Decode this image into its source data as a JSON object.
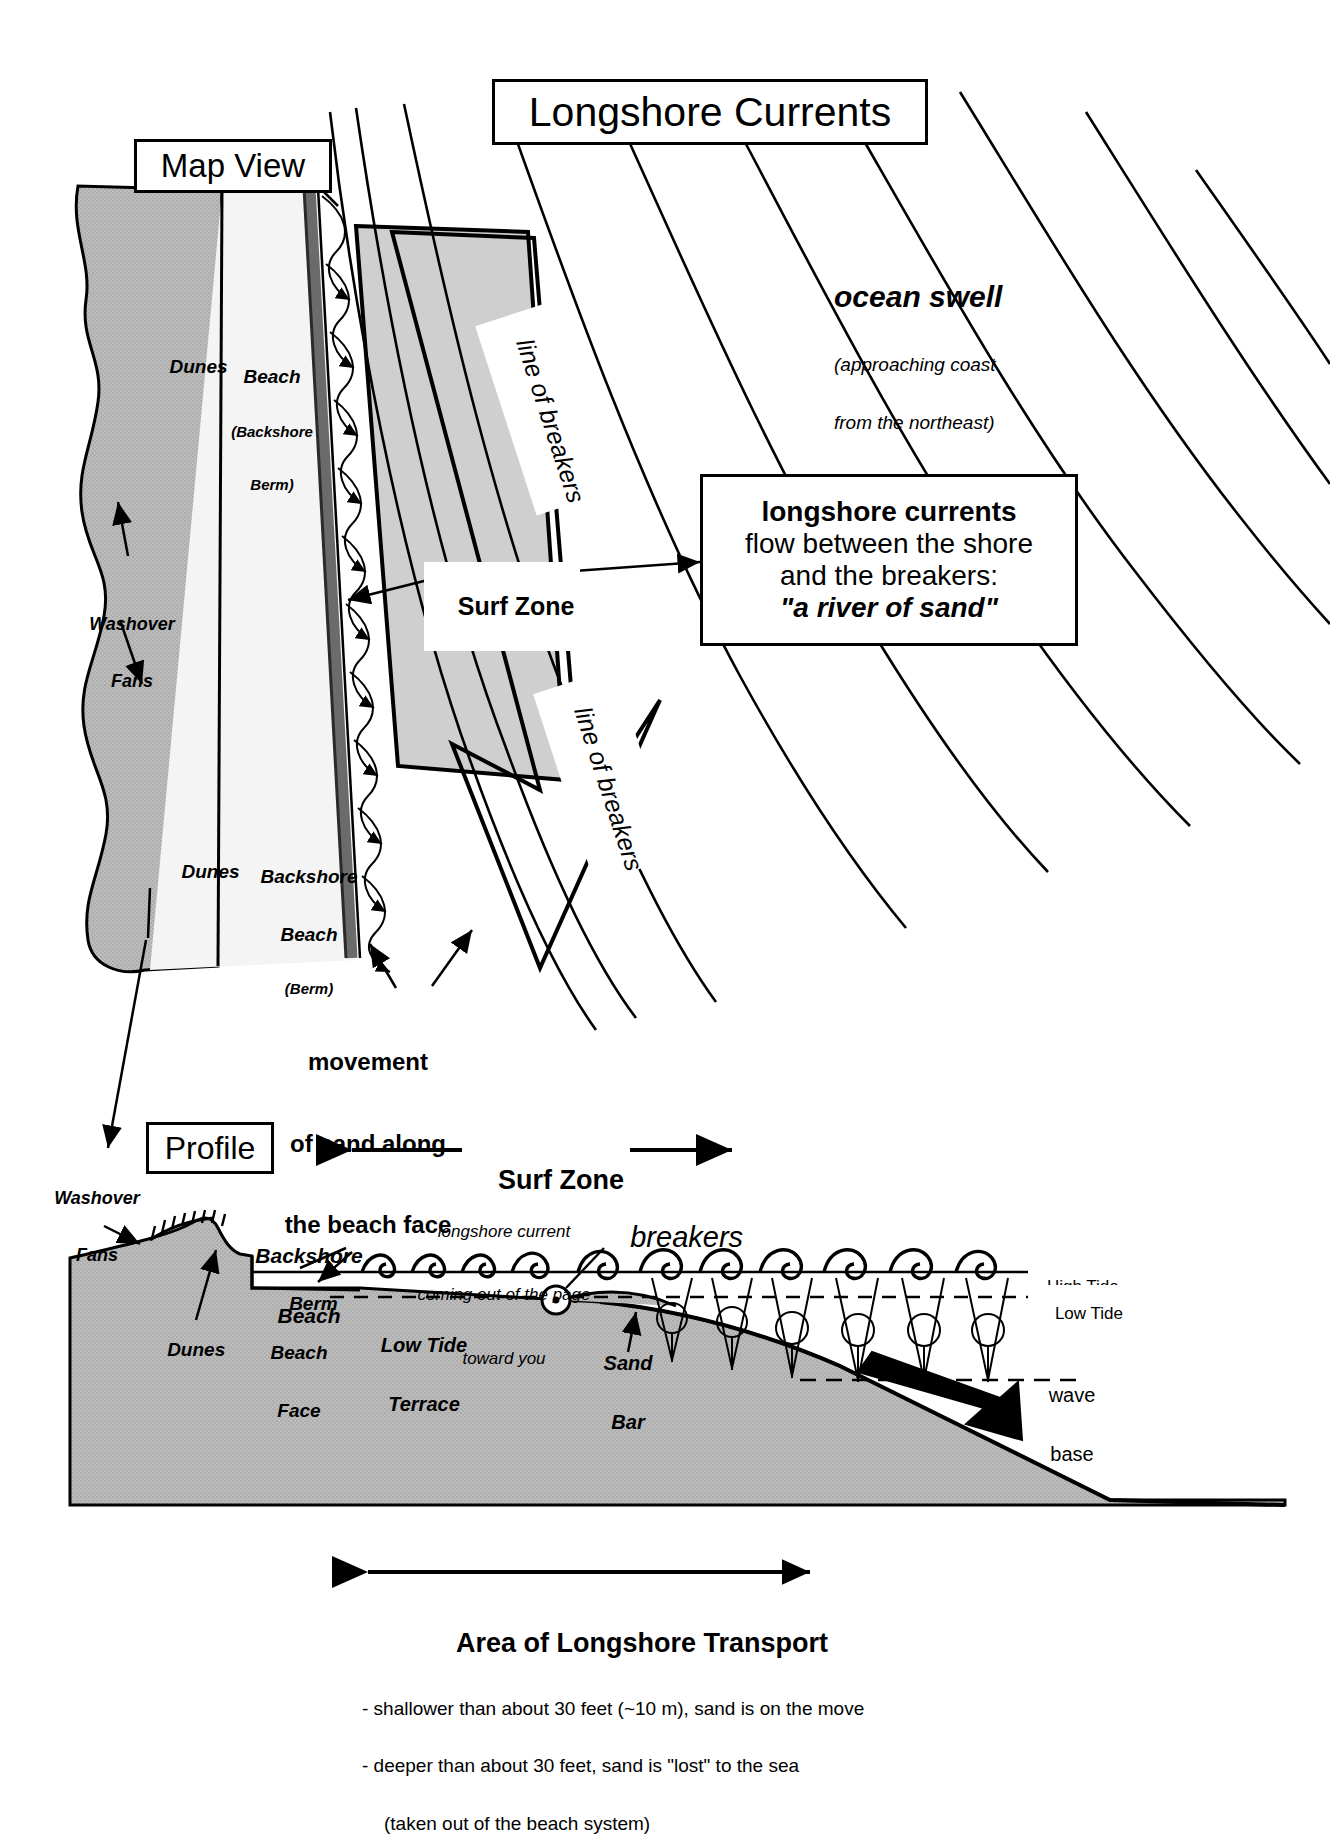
{
  "title": "Longshore Currents",
  "sections": {
    "map_view": "Map View",
    "profile": "Profile"
  },
  "map": {
    "dunes_top": "Dunes",
    "dunes_bottom": "Dunes",
    "beach_label_line1": "Beach",
    "beach_label_line2": "(Backshore",
    "beach_label_line3": "Berm)",
    "backshore_line1": "Backshore",
    "backshore_line2": "Beach",
    "backshore_line3": "(Berm)",
    "washover_line1": "Washover",
    "washover_line2": "Fans",
    "surf_zone": "Surf Zone",
    "line_of_breakers_upper": "line of breakers",
    "line_of_breakers_lower": "line of breakers",
    "ocean_swell": "ocean swell",
    "ocean_swell_sub_line1": "(approaching coast",
    "ocean_swell_sub_line2": "from the northeast)",
    "movement_line1": "movement",
    "movement_line2": "of sand along",
    "movement_line3": "the beach face"
  },
  "callout": {
    "line1": "longshore currents",
    "line2": "flow between the shore",
    "line3": "and the breakers:",
    "line4": "\"a river of sand\""
  },
  "profile": {
    "surf_zone": "Surf Zone",
    "washover_line1": "Washover",
    "washover_line2": "Fans",
    "dunes": "Dunes",
    "backshore_line1": "Backshore",
    "backshore_line2": "Beach",
    "berm": "Berm",
    "beach_face_line1": "Beach",
    "beach_face_line2": "Face",
    "low_tide_terrace_line1": "Low Tide",
    "low_tide_terrace_line2": "Terrace",
    "sand_bar_line1": "Sand",
    "sand_bar_line2": "Bar",
    "breakers": "breakers",
    "current_note_line1": "longshore current",
    "current_note_line2": "coming out of the page",
    "current_note_line3": "toward you",
    "high_tide": "High Tide",
    "low_tide": "Low Tide",
    "wave_base_line1": "wave",
    "wave_base_line2": "base",
    "transport_title": "Area of Longshore Transport",
    "transport_bullet1": "- shallower than about 30 feet (~10 m), sand is on the move",
    "transport_bullet2": "- deeper than about 30 feet, sand is \"lost\" to the sea",
    "transport_bullet3": "(taken out of the beach system)"
  },
  "colors": {
    "ink": "#000000",
    "dune_fill": "#b5b5b5",
    "beach_fill": "#f2f2f2",
    "surf_fill": "#cfcfcf",
    "water_fill": "#ffffff",
    "sediment_fill": "#bdbdbd",
    "shore_dark": "#555555"
  }
}
